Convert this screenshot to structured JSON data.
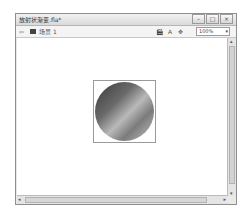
{
  "window": {
    "title": "放射状渐变.fla*",
    "controls": {
      "minimize": "–",
      "maximize": "□",
      "close": "×"
    }
  },
  "toolbar": {
    "back_icon": "⇦",
    "scene_label": "场景 1",
    "icons": [
      "edit-scene-icon",
      "edit-symbol-icon",
      "center-stage-icon"
    ],
    "edit_scene_glyph": "🎬",
    "edit_symbol_glyph": "A",
    "center_glyph": "✥",
    "zoom_value": "100%",
    "zoom_arrow": "▾"
  },
  "stage": {
    "object": "radial-gradient-circle",
    "colors": {
      "dark": "#3a3a3a",
      "light": "#c4c4c4"
    }
  },
  "scroll": {
    "up": "▴",
    "down": "▾",
    "left": "◂",
    "right": "▸"
  }
}
